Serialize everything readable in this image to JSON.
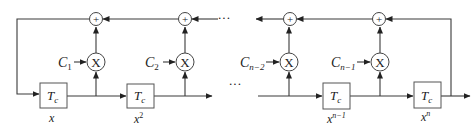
{
  "diagram": {
    "type": "block-diagram",
    "delay_blocks": [
      {
        "label": "T",
        "subscript": "c",
        "caption": "x",
        "caption_sup": ""
      },
      {
        "label": "T",
        "subscript": "c",
        "caption": "x",
        "caption_sup": "2"
      },
      {
        "label": "T",
        "subscript": "c",
        "caption": "x",
        "caption_sup": "n−1"
      },
      {
        "label": "T",
        "subscript": "c",
        "caption": "x",
        "caption_sup": "n"
      }
    ],
    "multipliers": [
      {
        "symbol": "X",
        "coef": "C",
        "coef_sub": "1"
      },
      {
        "symbol": "X",
        "coef": "C",
        "coef_sub": "2"
      },
      {
        "symbol": "X",
        "coef": "C",
        "coef_sub": "n−2"
      },
      {
        "symbol": "X",
        "coef": "C",
        "coef_sub": "n−1"
      }
    ],
    "adders": [
      {
        "symbol": "+"
      },
      {
        "symbol": "+"
      },
      {
        "symbol": "+"
      },
      {
        "symbol": "+"
      }
    ],
    "ellipsis_top": "···",
    "ellipsis_bottom": "···"
  },
  "colors": {
    "line": "#3a3a3a",
    "box_border": "#555555",
    "background": "#ffffff"
  }
}
